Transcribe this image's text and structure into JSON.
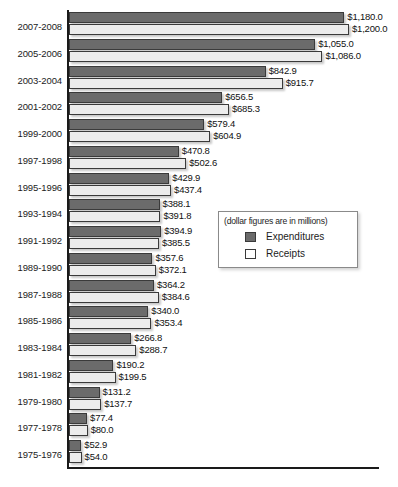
{
  "chart_data": {
    "type": "bar",
    "orientation": "horizontal",
    "title": "",
    "subtitle": "",
    "xlabel": "",
    "ylabel": "",
    "note": "(dollar figures are in millions)",
    "grid": false,
    "legend_position": "middle-right",
    "value_prefix": "$",
    "xlim": [
      0,
      1200
    ],
    "categories": [
      "2007-2008",
      "2005-2006",
      "2003-2004",
      "2001-2002",
      "1999-2000",
      "1997-1998",
      "1995-1996",
      "1993-1994",
      "1991-1992",
      "1989-1990",
      "1987-1988",
      "1985-1986",
      "1983-1984",
      "1981-1982",
      "1979-1980",
      "1977-1978",
      "1975-1976"
    ],
    "series": [
      {
        "name": "Expenditures",
        "color": "#6b6b6b",
        "values": [
          1180.0,
          1055.0,
          842.9,
          656.5,
          579.4,
          470.8,
          429.9,
          388.1,
          394.9,
          357.6,
          364.2,
          340.0,
          266.8,
          190.2,
          131.2,
          77.4,
          52.9
        ],
        "labels": [
          "$1,180.0",
          "$1,055.0",
          "$842.9",
          "$656.5",
          "$579.4",
          "$470.8",
          "$429.9",
          "$388.1",
          "$394.9",
          "$357.6",
          "$364.2",
          "$340.0",
          "$266.8",
          "$190.2",
          "$131.2",
          "$77.4",
          "$52.9"
        ]
      },
      {
        "name": "Receipts",
        "color": "#ececec",
        "values": [
          1200.0,
          1086.0,
          915.7,
          685.3,
          604.9,
          502.6,
          437.4,
          391.8,
          385.5,
          372.1,
          384.6,
          353.4,
          288.7,
          199.5,
          137.7,
          80.0,
          54.0
        ],
        "labels": [
          "$1,200.0",
          "$1,086.0",
          "$915.7",
          "$685.3",
          "$604.9",
          "$502.6",
          "$437.4",
          "$391.8",
          "$385.5",
          "$372.1",
          "$384.6",
          "$353.4",
          "$288.7",
          "$199.5",
          "$137.7",
          "$80.0",
          "$54.0"
        ]
      }
    ]
  },
  "legend": {
    "caption": "(dollar figures are in millions)",
    "entries": [
      {
        "label": "Expenditures",
        "swatch": "expenditures-swatch"
      },
      {
        "label": "Receipts",
        "swatch": "receipts-swatch"
      }
    ]
  }
}
